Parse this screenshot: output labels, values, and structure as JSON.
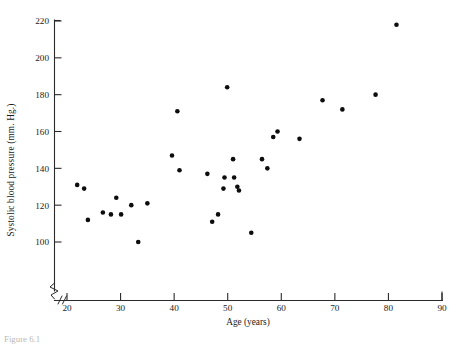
{
  "figure": {
    "caption": "Figure 6.1"
  },
  "chart_data": {
    "type": "scatter",
    "title": "",
    "xlabel": "Age (years)",
    "ylabel": "Systolic blood pressure (mm. Hg.)",
    "xlim": [
      20,
      90
    ],
    "ylim": [
      100,
      220
    ],
    "xticks": [
      20,
      30,
      40,
      50,
      60,
      70,
      80,
      90
    ],
    "yticks": [
      100,
      120,
      140,
      160,
      180,
      200,
      220
    ],
    "xtick_labels": [
      "20",
      "30",
      "40",
      "50",
      "60",
      "70",
      "80",
      "90"
    ],
    "ytick_labels": [
      "100",
      "120",
      "140",
      "160",
      "180",
      "200",
      "220"
    ],
    "grid": false,
    "legend": null,
    "axis_break_x": true,
    "axis_break_y": true,
    "marker": "filled-circle",
    "marker_color": "#0d0d0d",
    "marker_size_px": 4.6,
    "n_points": 33,
    "x": [
      21.9,
      23.2,
      23.9,
      26.7,
      28.2,
      29.2,
      30.1,
      32.0,
      33.3,
      35.0,
      39.6,
      40.6,
      41.0,
      46.2,
      47.1,
      48.2,
      49.2,
      49.4,
      49.9,
      51.0,
      51.2,
      51.8,
      52.1,
      54.4,
      56.4,
      57.4,
      58.5,
      59.3,
      63.4,
      67.7,
      71.4,
      77.6,
      81.5
    ],
    "y": [
      131,
      129,
      112,
      116,
      115,
      124,
      115,
      120,
      100,
      121,
      147,
      171,
      139,
      137,
      111,
      115,
      129,
      135,
      184,
      145,
      135,
      130,
      128,
      105,
      145,
      140,
      157,
      160,
      156,
      177,
      172,
      180,
      218
    ],
    "points": [
      {
        "age": 21.9,
        "bp": 131
      },
      {
        "age": 23.2,
        "bp": 129
      },
      {
        "age": 23.9,
        "bp": 112
      },
      {
        "age": 26.7,
        "bp": 116
      },
      {
        "age": 28.2,
        "bp": 115
      },
      {
        "age": 29.2,
        "bp": 124
      },
      {
        "age": 30.1,
        "bp": 115
      },
      {
        "age": 32.0,
        "bp": 120
      },
      {
        "age": 33.3,
        "bp": 100
      },
      {
        "age": 35.0,
        "bp": 121
      },
      {
        "age": 39.6,
        "bp": 147
      },
      {
        "age": 40.6,
        "bp": 171
      },
      {
        "age": 41.0,
        "bp": 139
      },
      {
        "age": 46.2,
        "bp": 137
      },
      {
        "age": 47.1,
        "bp": 111
      },
      {
        "age": 48.2,
        "bp": 115
      },
      {
        "age": 49.2,
        "bp": 129
      },
      {
        "age": 49.4,
        "bp": 135
      },
      {
        "age": 49.9,
        "bp": 184
      },
      {
        "age": 51.0,
        "bp": 145
      },
      {
        "age": 51.2,
        "bp": 135
      },
      {
        "age": 51.8,
        "bp": 130
      },
      {
        "age": 52.1,
        "bp": 128
      },
      {
        "age": 54.4,
        "bp": 105
      },
      {
        "age": 56.4,
        "bp": 145
      },
      {
        "age": 57.4,
        "bp": 140
      },
      {
        "age": 58.5,
        "bp": 157
      },
      {
        "age": 59.3,
        "bp": 160
      },
      {
        "age": 63.4,
        "bp": 156
      },
      {
        "age": 67.7,
        "bp": 177
      },
      {
        "age": 71.4,
        "bp": 172
      },
      {
        "age": 77.6,
        "bp": 180
      },
      {
        "age": 81.5,
        "bp": 218
      }
    ]
  }
}
